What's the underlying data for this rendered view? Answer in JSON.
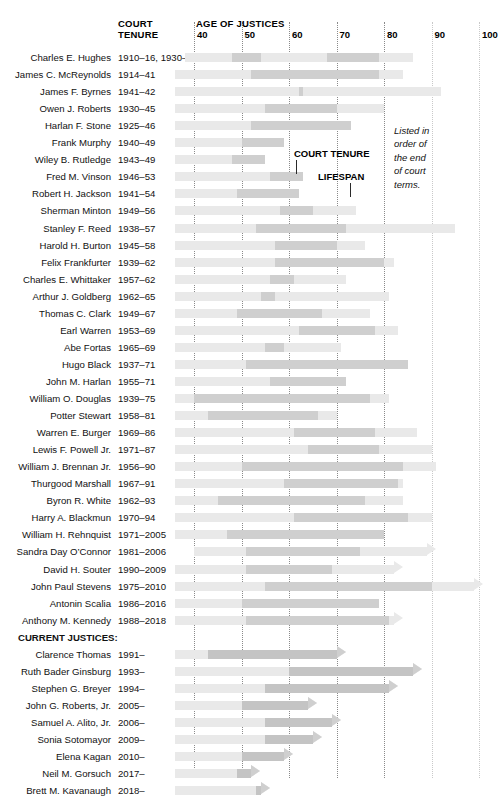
{
  "header": {
    "court_tenure_label": "COURT\nTENURE",
    "age_axis_label": "AGE OF JUSTICES",
    "axis_ticks": [
      "40",
      "50",
      "60",
      "70",
      "80",
      "90",
      "100"
    ]
  },
  "annotations": {
    "court_tenure": "COURT TENURE",
    "lifespan": "LIFESPAN",
    "note": "Listed in\norder of\nthe end\nof court\nterms."
  },
  "section_heading": "CURRENT JUSTICES:",
  "colors": {
    "lifespan_bar": "#e9e9e9",
    "tenure_bar": "#cfcfcf",
    "gridline": "#8a8a8a",
    "text": "#111111"
  },
  "chart_data": {
    "type": "bar",
    "title": "AGE OF JUSTICES",
    "xlabel": "Age of justices",
    "ylabel": "",
    "xlim": [
      36,
      103
    ],
    "grid": true,
    "legend": [
      "COURT TENURE",
      "LIFESPAN"
    ],
    "note": "Listed in order of the end of court terms.",
    "xticks": [
      40,
      50,
      60,
      70,
      80,
      90,
      100
    ],
    "rows": [
      {
        "name": "Charles E. Hughes",
        "tenure_text": "1910–16, 1930–41",
        "life_start": 38,
        "life_end": 86,
        "life_open": false,
        "tenure": [
          [
            48,
            54
          ],
          [
            68,
            79
          ]
        ]
      },
      {
        "name": "James C. McReynolds",
        "tenure_text": "1914–41",
        "life_start": 36,
        "life_end": 84,
        "life_open": false,
        "tenure": [
          [
            52,
            79
          ]
        ]
      },
      {
        "name": "James F. Byrnes",
        "tenure_text": "1941–42",
        "life_start": 36,
        "life_end": 92,
        "life_open": false,
        "tenure": [
          [
            62,
            63
          ]
        ]
      },
      {
        "name": "Owen J. Roberts",
        "tenure_text": "1930–45",
        "life_start": 36,
        "life_end": 80,
        "life_open": false,
        "tenure": [
          [
            55,
            70
          ]
        ]
      },
      {
        "name": "Harlan F. Stone",
        "tenure_text": "1925–46",
        "life_start": 36,
        "life_end": 73,
        "life_open": false,
        "tenure": [
          [
            52,
            73
          ]
        ]
      },
      {
        "name": "Frank Murphy",
        "tenure_text": "1940–49",
        "life_start": 36,
        "life_end": 59,
        "life_open": false,
        "tenure": [
          [
            50,
            59
          ]
        ]
      },
      {
        "name": "Wiley B. Rutledge",
        "tenure_text": "1943–49",
        "life_start": 36,
        "life_end": 55,
        "life_open": false,
        "tenure": [
          [
            48,
            55
          ]
        ]
      },
      {
        "name": "Fred M. Vinson",
        "tenure_text": "1946–53",
        "life_start": 36,
        "life_end": 63,
        "life_open": false,
        "tenure": [
          [
            56,
            63
          ]
        ]
      },
      {
        "name": "Robert H. Jackson",
        "tenure_text": "1941–54",
        "life_start": 36,
        "life_end": 62,
        "life_open": false,
        "tenure": [
          [
            49,
            62
          ]
        ]
      },
      {
        "name": "Sherman Minton",
        "tenure_text": "1949–56",
        "life_start": 36,
        "life_end": 74,
        "life_open": false,
        "tenure": [
          [
            58,
            65
          ]
        ]
      },
      {
        "name": "Stanley F. Reed",
        "tenure_text": "1938–57",
        "life_start": 36,
        "life_end": 95,
        "life_open": false,
        "tenure": [
          [
            53,
            72
          ]
        ]
      },
      {
        "name": "Harold H. Burton",
        "tenure_text": "1945–58",
        "life_start": 36,
        "life_end": 76,
        "life_open": false,
        "tenure": [
          [
            57,
            70
          ]
        ]
      },
      {
        "name": "Felix Frankfurter",
        "tenure_text": "1939–62",
        "life_start": 36,
        "life_end": 82,
        "life_open": false,
        "tenure": [
          [
            57,
            80
          ]
        ]
      },
      {
        "name": "Charles E. Whittaker",
        "tenure_text": "1957–62",
        "life_start": 36,
        "life_end": 72,
        "life_open": false,
        "tenure": [
          [
            56,
            61
          ]
        ]
      },
      {
        "name": "Arthur J. Goldberg",
        "tenure_text": "1962–65",
        "life_start": 36,
        "life_end": 81,
        "life_open": false,
        "tenure": [
          [
            54,
            57
          ]
        ]
      },
      {
        "name": "Thomas C. Clark",
        "tenure_text": "1949–67",
        "life_start": 36,
        "life_end": 77,
        "life_open": false,
        "tenure": [
          [
            49,
            67
          ]
        ]
      },
      {
        "name": "Earl Warren",
        "tenure_text": "1953–69",
        "life_start": 36,
        "life_end": 83,
        "life_open": false,
        "tenure": [
          [
            62,
            78
          ]
        ]
      },
      {
        "name": "Abe Fortas",
        "tenure_text": "1965–69",
        "life_start": 36,
        "life_end": 71,
        "life_open": false,
        "tenure": [
          [
            55,
            59
          ]
        ]
      },
      {
        "name": "Hugo Black",
        "tenure_text": "1937–71",
        "life_start": 36,
        "life_end": 85,
        "life_open": false,
        "tenure": [
          [
            51,
            85
          ]
        ]
      },
      {
        "name": "John M. Harlan",
        "tenure_text": "1955–71",
        "life_start": 36,
        "life_end": 72,
        "life_open": false,
        "tenure": [
          [
            56,
            72
          ]
        ]
      },
      {
        "name": "William O. Douglas",
        "tenure_text": "1939–75",
        "life_start": 36,
        "life_end": 81,
        "life_open": false,
        "tenure": [
          [
            40,
            77
          ]
        ]
      },
      {
        "name": "Potter Stewart",
        "tenure_text": "1958–81",
        "life_start": 36,
        "life_end": 70,
        "life_open": false,
        "tenure": [
          [
            43,
            66
          ]
        ]
      },
      {
        "name": "Warren E. Burger",
        "tenure_text": "1969–86",
        "life_start": 36,
        "life_end": 87,
        "life_open": false,
        "tenure": [
          [
            61,
            78
          ]
        ]
      },
      {
        "name": "Lewis F. Powell Jr.",
        "tenure_text": "1971–87",
        "life_start": 36,
        "life_end": 90,
        "life_open": false,
        "tenure": [
          [
            64,
            79
          ]
        ]
      },
      {
        "name": "William J. Brennan Jr.",
        "tenure_text": "1956–90",
        "life_start": 36,
        "life_end": 91,
        "life_open": false,
        "tenure": [
          [
            50,
            84
          ]
        ]
      },
      {
        "name": "Thurgood Marshall",
        "tenure_text": "1967–91",
        "life_start": 36,
        "life_end": 84,
        "life_open": false,
        "tenure": [
          [
            59,
            83
          ]
        ]
      },
      {
        "name": "Byron R. White",
        "tenure_text": "1962–93",
        "life_start": 36,
        "life_end": 84,
        "life_open": false,
        "tenure": [
          [
            45,
            76
          ]
        ]
      },
      {
        "name": "Harry A. Blackmun",
        "tenure_text": "1970–94",
        "life_start": 36,
        "life_end": 90,
        "life_open": false,
        "tenure": [
          [
            61,
            85
          ]
        ]
      },
      {
        "name": "William H. Rehnquist",
        "tenure_text": "1971–2005",
        "life_start": 36,
        "life_end": 80,
        "life_open": false,
        "tenure": [
          [
            47,
            80
          ]
        ]
      },
      {
        "name": "Sandra Day O’Connor",
        "tenure_text": "1981–2006",
        "life_start": 40,
        "life_end": 89,
        "life_open": true,
        "tenure": [
          [
            51,
            75
          ]
        ]
      },
      {
        "name": "David H. Souter",
        "tenure_text": "1990–2009",
        "life_start": 36,
        "life_end": 82,
        "life_open": true,
        "tenure": [
          [
            51,
            69
          ]
        ]
      },
      {
        "name": "John Paul Stevens",
        "tenure_text": "1975–2010",
        "life_start": 36,
        "life_end": 99,
        "life_open": true,
        "tenure": [
          [
            55,
            90
          ]
        ]
      },
      {
        "name": "Antonin Scalia",
        "tenure_text": "1986–2016",
        "life_start": 36,
        "life_end": 79,
        "life_open": false,
        "tenure": [
          [
            50,
            79
          ]
        ]
      },
      {
        "name": "Anthony M. Kennedy",
        "tenure_text": "1988–2018",
        "life_start": 36,
        "life_end": 82,
        "life_open": true,
        "tenure": [
          [
            51,
            81
          ]
        ]
      },
      {
        "name": "CURRENT JUSTICES:",
        "section": true
      },
      {
        "name": "Clarence Thomas",
        "tenure_text": "1991–",
        "life_start": 36,
        "life_end": 70,
        "life_open": true,
        "tenure": [
          [
            43,
            70
          ]
        ],
        "tenure_open": true
      },
      {
        "name": "Ruth Bader Ginsburg",
        "tenure_text": "1993–",
        "life_start": 36,
        "life_end": 86,
        "life_open": true,
        "tenure": [
          [
            60,
            86
          ]
        ],
        "tenure_open": true
      },
      {
        "name": "Stephen G. Breyer",
        "tenure_text": "1994–",
        "life_start": 36,
        "life_end": 81,
        "life_open": true,
        "tenure": [
          [
            55,
            81
          ]
        ],
        "tenure_open": true
      },
      {
        "name": "John G. Roberts, Jr.",
        "tenure_text": "2005–",
        "life_start": 36,
        "life_end": 64,
        "life_open": true,
        "tenure": [
          [
            50,
            64
          ]
        ],
        "tenure_open": true
      },
      {
        "name": "Samuel A. Alito, Jr.",
        "tenure_text": "2006–",
        "life_start": 36,
        "life_end": 69,
        "life_open": true,
        "tenure": [
          [
            55,
            69
          ]
        ],
        "tenure_open": true
      },
      {
        "name": "Sonia Sotomayor",
        "tenure_text": "2009–",
        "life_start": 36,
        "life_end": 65,
        "life_open": true,
        "tenure": [
          [
            55,
            65
          ]
        ],
        "tenure_open": true
      },
      {
        "name": "Elena Kagan",
        "tenure_text": "2010–",
        "life_start": 36,
        "life_end": 59,
        "life_open": true,
        "tenure": [
          [
            50,
            59
          ]
        ],
        "tenure_open": true
      },
      {
        "name": "Neil M. Gorsuch",
        "tenure_text": "2017–",
        "life_start": 36,
        "life_end": 52,
        "life_open": true,
        "tenure": [
          [
            49,
            52
          ]
        ],
        "tenure_open": true
      },
      {
        "name": "Brett M. Kavanaugh",
        "tenure_text": "2018–",
        "life_start": 36,
        "life_end": 54,
        "life_open": true,
        "tenure": [
          [
            53,
            54
          ]
        ],
        "tenure_open": true
      }
    ]
  }
}
